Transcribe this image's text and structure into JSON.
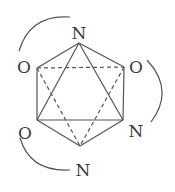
{
  "diagram": {
    "type": "octahedral-complex",
    "stroke_color": "#555555",
    "label_color": "#3a3a3a",
    "vertices": [
      {
        "id": "top",
        "label": "N",
        "x": 79,
        "y": 43,
        "lx": 79,
        "ly": 33
      },
      {
        "id": "upper-left",
        "label": "O",
        "x": 37,
        "y": 68,
        "lx": 24,
        "ly": 67
      },
      {
        "id": "upper-right",
        "label": "O",
        "x": 124,
        "y": 67,
        "lx": 136,
        "ly": 67
      },
      {
        "id": "lower-left",
        "label": "O",
        "x": 37,
        "y": 120,
        "lx": 25,
        "ly": 133
      },
      {
        "id": "lower-right",
        "label": "N",
        "x": 123,
        "y": 120,
        "lx": 136,
        "ly": 131
      },
      {
        "id": "bottom",
        "label": "N",
        "x": 80,
        "y": 146,
        "lx": 83,
        "ly": 170
      }
    ],
    "solid_edges": [
      [
        "top",
        "upper-left"
      ],
      [
        "top",
        "upper-right"
      ],
      [
        "upper-left",
        "lower-left"
      ],
      [
        "upper-right",
        "lower-right"
      ],
      [
        "lower-left",
        "bottom"
      ],
      [
        "lower-right",
        "bottom"
      ],
      [
        "top",
        "lower-left"
      ],
      [
        "top",
        "lower-right"
      ],
      [
        "lower-left",
        "lower-right"
      ]
    ],
    "dashed_edges": [
      [
        "upper-left",
        "upper-right"
      ],
      [
        "upper-left",
        "bottom"
      ],
      [
        "upper-right",
        "bottom"
      ]
    ],
    "chelate_arcs": [
      {
        "name": "arc-o-n-top",
        "connects": [
          "upper-left O",
          "top N"
        ],
        "path": "M 19 51 Q 30 14 70 17"
      },
      {
        "name": "arc-o-n-right",
        "connects": [
          "upper-right O",
          "lower-right N"
        ],
        "path": "M 147 60 Q 175 90 151 122"
      },
      {
        "name": "arc-o-n-bottom",
        "connects": [
          "lower-left O",
          "bottom N"
        ],
        "path": "M 20 138 Q 30 172 70 170"
      }
    ]
  }
}
